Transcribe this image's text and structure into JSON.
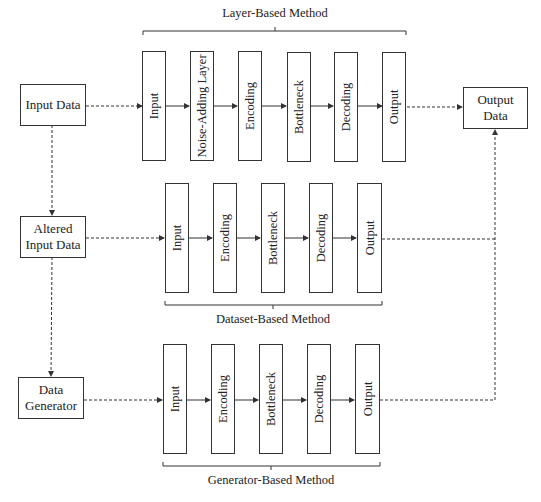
{
  "diagram": {
    "sources": {
      "input_data": "Input Data",
      "altered_input_data": "Altered Input Data",
      "data_generator": "Data Generator"
    },
    "output_data": "Output Data",
    "methods": [
      {
        "title": "Layer-Based Method",
        "layers": [
          "Input",
          "Noise-Adding Layer",
          "Encoding",
          "Bottleneck",
          "Decoding",
          "Output"
        ]
      },
      {
        "title": "Dataset-Based Method",
        "layers": [
          "Input",
          "Encoding",
          "Bottleneck",
          "Decoding",
          "Output"
        ]
      },
      {
        "title": "Generator-Based Method",
        "layers": [
          "Input",
          "Encoding",
          "Bottleneck",
          "Decoding",
          "Output"
        ]
      }
    ],
    "colors": {
      "stroke": "#333333",
      "background": "#ffffff"
    }
  }
}
